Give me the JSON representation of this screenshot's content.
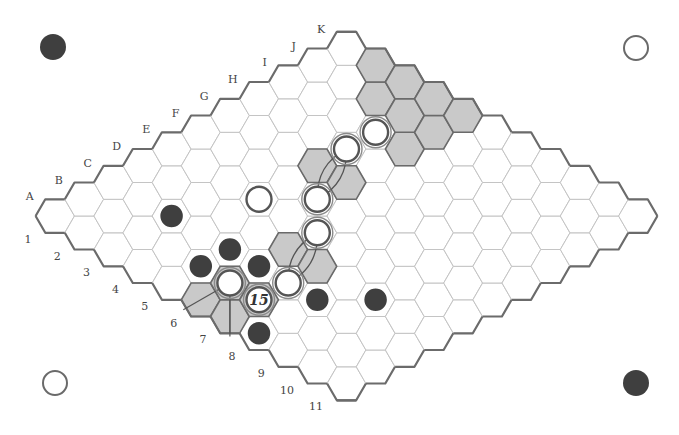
{
  "board": {
    "size": 11,
    "letters": [
      "A",
      "B",
      "C",
      "D",
      "E",
      "F",
      "G",
      "H",
      "I",
      "J",
      "K"
    ],
    "numbers": [
      "1",
      "2",
      "3",
      "4",
      "5",
      "6",
      "7",
      "8",
      "9",
      "10",
      "11"
    ],
    "geometry": {
      "origin_x": 55,
      "origin_y": 216,
      "step_x": 29.15,
      "step_y": 16.75,
      "hex_radius": 19.4
    },
    "colors": {
      "black": "#3f3f3f",
      "white": "#ffffff",
      "shade": "#c9c9c9",
      "grid": "#c4c4c4",
      "border": "#6b6b6b"
    }
  },
  "shaded_cells": [
    "K2",
    "K3",
    "K4",
    "K5",
    "J3",
    "J4",
    "J5",
    "I5",
    "G4",
    "G5",
    "D6",
    "D7",
    "A6",
    "A7",
    "B7",
    "B6"
  ],
  "stones": [
    {
      "cell": "C3",
      "color": "black"
    },
    {
      "cell": "E4",
      "color": "white"
    },
    {
      "cell": "I4",
      "color": "white",
      "ring": true
    },
    {
      "cell": "H4",
      "color": "white",
      "ring": true
    },
    {
      "cell": "F5",
      "color": "white",
      "ring": true
    },
    {
      "cell": "E6",
      "color": "white",
      "ring": true
    },
    {
      "cell": "C7",
      "color": "white",
      "ring": true
    },
    {
      "cell": "B6",
      "color": "white",
      "ring": true
    },
    {
      "cell": "B7",
      "color": "white",
      "label": "15",
      "ring": true
    },
    {
      "cell": "B5",
      "color": "black"
    },
    {
      "cell": "C5",
      "color": "black"
    },
    {
      "cell": "C6",
      "color": "black"
    },
    {
      "cell": "C8",
      "color": "black"
    },
    {
      "cell": "D9",
      "color": "black"
    },
    {
      "cell": "A8",
      "color": "black"
    }
  ],
  "bridges": [
    {
      "from": "H4",
      "to": "F5",
      "via": [
        "G4",
        "G5"
      ]
    },
    {
      "from": "E6",
      "to": "C7",
      "via": [
        "D6",
        "D7"
      ]
    }
  ],
  "edge_template": {
    "stone": "B6",
    "cells": [
      "A6",
      "A7"
    ]
  },
  "corner_stones": [
    {
      "position": "top-left",
      "color": "black",
      "x": 53,
      "y": 47
    },
    {
      "position": "top-right",
      "color": "white",
      "x": 636,
      "y": 48
    },
    {
      "position": "bottom-left",
      "color": "white",
      "x": 55,
      "y": 383
    },
    {
      "position": "bottom-right",
      "color": "black",
      "x": 636,
      "y": 383
    }
  ],
  "move_label": "15"
}
